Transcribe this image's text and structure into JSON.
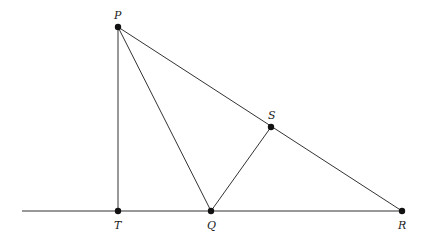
{
  "diagram": {
    "type": "geometry",
    "points": {
      "P": {
        "label": "P",
        "x": 118,
        "y": 27
      },
      "S": {
        "label": "S",
        "x": 271,
        "y": 127
      },
      "T": {
        "label": "T",
        "x": 118,
        "y": 211
      },
      "Q": {
        "label": "Q",
        "x": 211,
        "y": 211
      },
      "R": {
        "label": "R",
        "x": 402,
        "y": 211
      }
    },
    "segments": [
      [
        "P",
        "T"
      ],
      [
        "P",
        "Q"
      ],
      [
        "P",
        "R"
      ],
      [
        "S",
        "Q"
      ],
      [
        "T",
        "R"
      ]
    ],
    "baseline_start_x": 22,
    "colors": {
      "line": "#333333",
      "point": "#111111",
      "label": "#222222"
    }
  }
}
